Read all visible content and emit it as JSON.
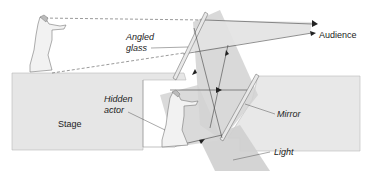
{
  "diagram": {
    "type": "Pepper's ghost illusion",
    "labels": {
      "angled_glass_line1": "Angled",
      "angled_glass_line2": "glass",
      "audience": "Audience",
      "hidden_actor_line1": "Hidden",
      "hidden_actor_line2": "actor",
      "stage": "Stage",
      "mirror": "Mirror",
      "light": "Light"
    },
    "colors": {
      "stage_fill": "#e6e6e6",
      "beam_fill": "#cfcfcf",
      "glass_fill": "#dcdcdc",
      "line": "#333333"
    }
  }
}
